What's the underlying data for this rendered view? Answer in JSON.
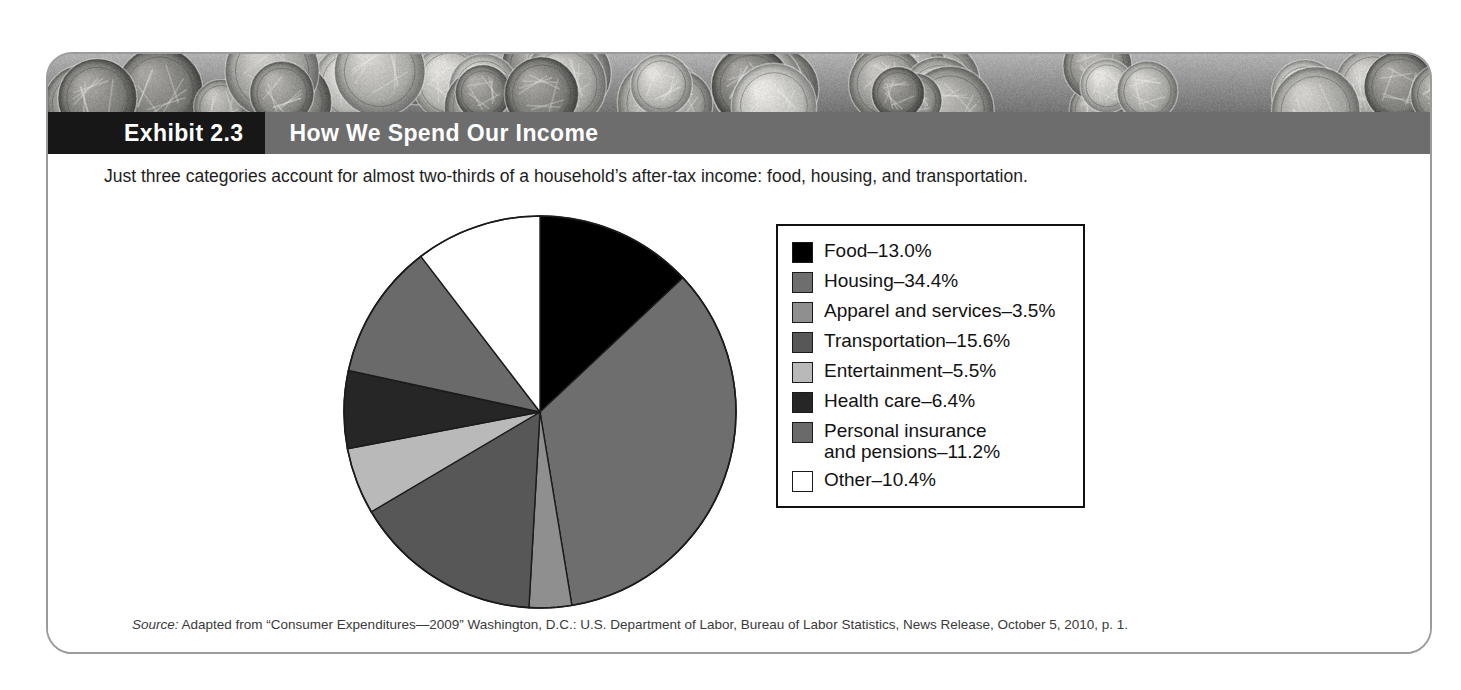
{
  "exhibit": {
    "number_label": "Exhibit 2.3",
    "title": "How We Spend Our Income",
    "intro": "Just three categories account for almost two-thirds of a household’s after-tax income: food, housing, and transportation.",
    "source_prefix": "Source:",
    "source_text": " Adapted from “Consumer Expenditures—2009” Washington, D.C.: U.S. Department of Labor, Bureau of Labor Statistics, News Release, October 5, 2010, p. 1.",
    "header_bg": "#6d6d6d",
    "number_bg": "#171717",
    "frame_border": "#9b9b9b"
  },
  "chart_data": {
    "type": "pie",
    "title": "How We Spend Our Income",
    "categories": [
      "Food",
      "Housing",
      "Apparel and services",
      "Transportation",
      "Entertainment",
      "Health care",
      "Personal insurance and pensions",
      "Other"
    ],
    "values": [
      13.0,
      34.4,
      3.5,
      15.6,
      5.5,
      6.4,
      11.2,
      10.4
    ],
    "value_unit": "%",
    "colors": [
      "#000000",
      "#6e6e6e",
      "#8f8f8f",
      "#575757",
      "#b9b9b9",
      "#262626",
      "#6a6a6a",
      "#ffffff"
    ],
    "start_angle_deg": 0,
    "direction": "clockwise",
    "legend_position": "right",
    "legend": [
      {
        "label": "Food–13.0%",
        "color": "#000000"
      },
      {
        "label": "Housing–34.4%",
        "color": "#6e6e6e"
      },
      {
        "label": "Apparel and services–3.5%",
        "color": "#8f8f8f"
      },
      {
        "label": "Transportation–15.6%",
        "color": "#575757"
      },
      {
        "label": "Entertainment–5.5%",
        "color": "#b9b9b9"
      },
      {
        "label": "Health care–6.4%",
        "color": "#262626"
      },
      {
        "label": "Personal insurance\nand pensions–11.2%",
        "color": "#6a6a6a"
      },
      {
        "label": "Other–10.4%",
        "color": "#ffffff"
      }
    ]
  }
}
